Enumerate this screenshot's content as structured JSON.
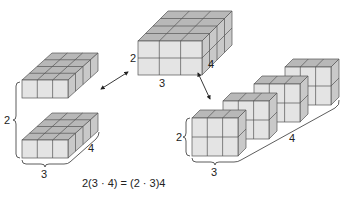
{
  "diagram": {
    "colors": {
      "front": "#e4e4e4",
      "top": "#b8b8b8",
      "side": "#c9c9c9",
      "edge": "#555555",
      "text": "#222222"
    },
    "center_block": {
      "height_label": "2",
      "width_label": "3",
      "depth_label": "4"
    },
    "left_group": {
      "stack_label": "2",
      "width_label": "3",
      "depth_label": "4"
    },
    "right_group": {
      "height_label": "2",
      "width_label": "3",
      "count_label": "4"
    },
    "equation": "2(3 · 4) = (2 · 3)4"
  }
}
